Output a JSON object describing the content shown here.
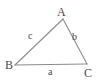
{
  "figure": {
    "type": "geometry-diagram",
    "shape": "triangle",
    "background_color": "#ffffff",
    "stroke_color": "#8c8c8c",
    "text_color": "#4a4a4a",
    "width": 101,
    "height": 83
  },
  "vertices": [
    {
      "name": "A",
      "label": "A",
      "x": 63,
      "y": 19
    },
    {
      "name": "B",
      "label": "B",
      "x": 15,
      "y": 65
    },
    {
      "name": "C",
      "label": "C",
      "x": 87,
      "y": 64
    }
  ],
  "sides": [
    {
      "name": "a",
      "label": "a",
      "between": "B-C"
    },
    {
      "name": "b",
      "label": "b",
      "between": "A-C"
    },
    {
      "name": "c",
      "label": "c",
      "between": "A-B"
    }
  ]
}
